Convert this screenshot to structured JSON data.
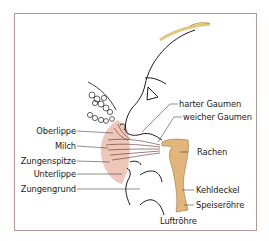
{
  "figure": {
    "colors": {
      "frame_border": "#b89a94",
      "throat_fill": "#e2b67a",
      "breast_tint": "#e9b5a8",
      "hair": "#e8d08a",
      "line": "#1a1a1a"
    },
    "labels_left": [
      {
        "id": "oberlippe",
        "text": "Oberlippe"
      },
      {
        "id": "milch",
        "text": "Milch"
      },
      {
        "id": "zungenspitze",
        "text": "Zungenspitze"
      },
      {
        "id": "unterlippe",
        "text": "Unterlippe"
      },
      {
        "id": "zungengrund",
        "text": "Zungengrund"
      }
    ],
    "labels_right": [
      {
        "id": "harter-gaumen",
        "text": "harter Gaumen"
      },
      {
        "id": "weicher-gaumen",
        "text": "weicher Gaumen"
      },
      {
        "id": "rachen",
        "text": "Rachen"
      },
      {
        "id": "kehldeckel",
        "text": "Kehldeckel"
      },
      {
        "id": "speiseroehre",
        "text": "Speiseröhre"
      }
    ],
    "labels_bottom": [
      {
        "id": "luftroehre",
        "text": "Luftröhre"
      }
    ]
  }
}
